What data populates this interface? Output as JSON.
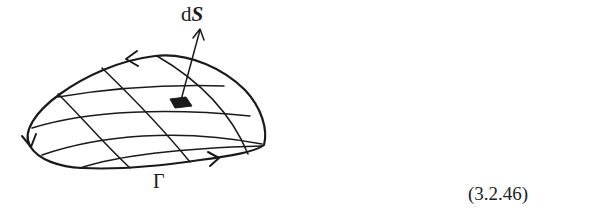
{
  "figure": {
    "labels": {
      "surface_element_prefix": "d",
      "surface_element_symbol": "S",
      "boundary_curve": "Γ"
    },
    "equation_number": "(3.2.46)",
    "colors": {
      "stroke": "#1a1a1a",
      "background": "#ffffff"
    }
  }
}
